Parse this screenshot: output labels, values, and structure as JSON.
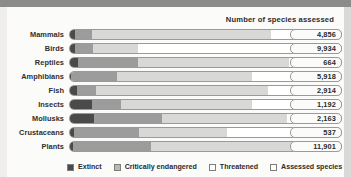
{
  "header": {
    "title": "Number of species  assessed"
  },
  "legend": {
    "items": [
      {
        "label": "Extinct",
        "swatch": "legend-swatch-extinct",
        "color": "#4a4a4a"
      },
      {
        "label": "Critically endangered",
        "swatch": "legend-swatch-critically-endangered",
        "color": "#b8b8b6"
      },
      {
        "label": "Threatened",
        "swatch": "legend-swatch-threatened",
        "color": "#ffffff"
      },
      {
        "label": "Assessed species",
        "swatch": "legend-swatch-assessed-species",
        "color": "#ffffff"
      }
    ]
  },
  "chart_data": {
    "type": "bar",
    "title": "Number of species  assessed",
    "xlabel": "",
    "ylabel": "",
    "orientation": "horizontal",
    "stacked": true,
    "grid": false,
    "legend_position": "bottom",
    "categories": [
      "Mammals",
      "Birds",
      "Reptiles",
      "Amphibians",
      "Fish",
      "Insects",
      "Mollusks",
      "Crustaceans",
      "Plants"
    ],
    "value_labels": [
      "4,856",
      "9,934",
      "664",
      "5,918",
      "2,914",
      "1,192",
      "2,163",
      "537",
      "11,901"
    ],
    "values": [
      4856,
      9934,
      664,
      5918,
      2914,
      1192,
      2163,
      537,
      11901
    ],
    "series": [
      {
        "name": "Extinct",
        "color": "#4a4a4a",
        "values": [
          2.0,
          2.0,
          3.0,
          0.5,
          2.5,
          8.0,
          9.0,
          1.5,
          1.0
        ]
      },
      {
        "name": "Critically endangered",
        "color": "#9c9c9c",
        "values": [
          6.0,
          6.5,
          22.0,
          17.0,
          7.0,
          11.0,
          25.0,
          24.0,
          29.0
        ]
      },
      {
        "name": "Threatened",
        "color": "#d8d8d6",
        "values": [
          66.0,
          16.5,
          56.0,
          49.5,
          63.5,
          48.0,
          46.0,
          32.5,
          60.0
        ]
      },
      {
        "name": "Assessed species",
        "color": "#ffffff",
        "values": [
          26.0,
          75.0,
          19.0,
          33.0,
          27.0,
          33.0,
          20.0,
          42.0,
          10.0
        ]
      }
    ],
    "segment_units": "percent of bar width",
    "rows": [
      {
        "category": "Mammals",
        "value_label": "4,856",
        "segments": [
          2.0,
          6.0,
          66.0,
          26.0
        ]
      },
      {
        "category": "Birds",
        "value_label": "9,934",
        "segments": [
          2.0,
          6.5,
          16.5,
          75.0
        ]
      },
      {
        "category": "Reptiles",
        "value_label": "664",
        "segments": [
          3.0,
          22.0,
          56.0,
          19.0
        ]
      },
      {
        "category": "Amphibians",
        "value_label": "5,918",
        "segments": [
          0.5,
          17.0,
          49.5,
          33.0
        ]
      },
      {
        "category": "Fish",
        "value_label": "2,914",
        "segments": [
          2.5,
          7.0,
          63.5,
          27.0
        ]
      },
      {
        "category": "Insects",
        "value_label": "1,192",
        "segments": [
          8.0,
          11.0,
          48.0,
          33.0
        ]
      },
      {
        "category": "Mollusks",
        "value_label": "2,163",
        "segments": [
          9.0,
          25.0,
          46.0,
          20.0
        ]
      },
      {
        "category": "Crustaceans",
        "value_label": "537",
        "segments": [
          1.5,
          24.0,
          32.5,
          42.0
        ]
      },
      {
        "category": "Plants",
        "value_label": "11,901",
        "segments": [
          1.0,
          29.0,
          60.0,
          10.0
        ]
      }
    ]
  }
}
